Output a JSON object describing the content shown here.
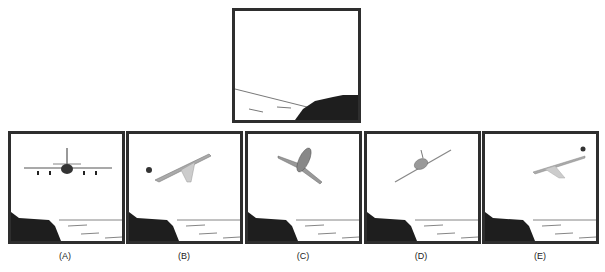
{
  "question": {
    "reference_panel": {
      "description": "Cliff on right side with sea horizon, empty sky"
    },
    "options": [
      {
        "label": "(A)",
        "description": "Airplane front view, level, above cliff on left"
      },
      {
        "label": "(B)",
        "description": "Airplane side view banking, nose up to the right, sun on left"
      },
      {
        "label": "(C)",
        "description": "Airplane from below, climbing"
      },
      {
        "label": "(D)",
        "description": "Airplane banking, tilted wings"
      },
      {
        "label": "(E)",
        "description": "Airplane side view, sun on right"
      }
    ]
  },
  "colors": {
    "frame": "#2e2e2e",
    "cliff": "#1e1e1e",
    "background": "#ffffff"
  }
}
